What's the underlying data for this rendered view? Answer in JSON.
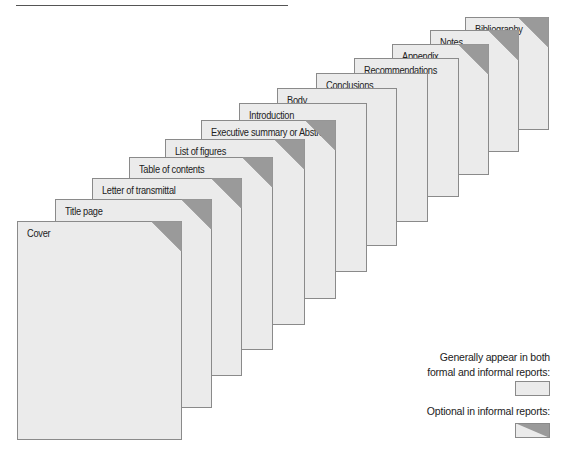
{
  "colors": {
    "page_fill": "#ebebeb",
    "page_border": "#8a8a8a",
    "corner_fill": "#9a9a9a",
    "text": "#222222"
  },
  "pages": [
    {
      "label": "Cover",
      "left": 17,
      "top": 221,
      "right": 182,
      "bottom": 440,
      "optional": true
    },
    {
      "label": "Title page",
      "left": 55,
      "top": 199,
      "right": 212,
      "bottom": 408,
      "optional": true
    },
    {
      "label": "Letter of transmittal",
      "left": 92,
      "top": 178,
      "right": 242,
      "bottom": 376,
      "optional": true
    },
    {
      "label": "Table of contents",
      "left": 129,
      "top": 157,
      "right": 273,
      "bottom": 350,
      "optional": true
    },
    {
      "label": "List of figures",
      "left": 165,
      "top": 139,
      "right": 305,
      "bottom": 325,
      "optional": true
    },
    {
      "label": "Executive summary or Abstract",
      "left": 201,
      "top": 120,
      "right": 336,
      "bottom": 299,
      "optional": true
    },
    {
      "label": "Introduction",
      "left": 239,
      "top": 103,
      "right": 367,
      "bottom": 272,
      "optional": false
    },
    {
      "label": "Body",
      "left": 277,
      "top": 88,
      "right": 397,
      "bottom": 246,
      "optional": false
    },
    {
      "label": "Conclusions",
      "left": 316,
      "top": 73,
      "right": 428,
      "bottom": 222,
      "optional": false
    },
    {
      "label": "Recommendations",
      "left": 354,
      "top": 58,
      "right": 459,
      "bottom": 197,
      "optional": false
    },
    {
      "label": "Appendix",
      "left": 392,
      "top": 44,
      "right": 489,
      "bottom": 175,
      "optional": true
    },
    {
      "label": "Notes",
      "left": 430,
      "top": 30,
      "right": 519,
      "bottom": 152,
      "optional": true
    },
    {
      "label": "Bibliography",
      "left": 465,
      "top": 17,
      "right": 549,
      "bottom": 130,
      "optional": true
    }
  ],
  "legend": {
    "general": {
      "line1": "Generally appear in both",
      "line2": "formal and informal reports:"
    },
    "optional": {
      "line1": "Optional in informal reports:"
    }
  }
}
